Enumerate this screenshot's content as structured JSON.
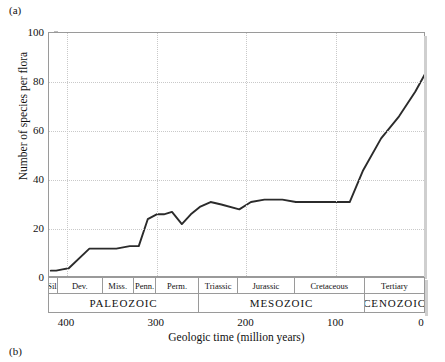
{
  "figure": {
    "panel_a_label": "(a)",
    "panel_b_label": "(b)"
  },
  "chart_data": {
    "type": "line",
    "title": "",
    "xlabel": "Geologic time (million years)",
    "ylabel": "Number of species per flora",
    "xlim": [
      420,
      0
    ],
    "ylim": [
      0,
      100
    ],
    "x_axis_reversed": true,
    "grid": "dotted",
    "legend": "none",
    "y_ticks": [
      0,
      20,
      40,
      60,
      80,
      100
    ],
    "y_tick_labels": [
      "0",
      "20",
      "40",
      "60",
      "80",
      "100"
    ],
    "x_ticks": [
      400,
      300,
      200,
      100,
      0
    ],
    "x_tick_labels": [
      "400",
      "300",
      "200",
      "100",
      "0"
    ],
    "series": [
      {
        "name": "Number of species per flora",
        "color": "#2b2b2b",
        "x": [
          418,
          412,
          405,
          398,
          375,
          360,
          352,
          345,
          330,
          320,
          310,
          300,
          292,
          283,
          272,
          262,
          252,
          240,
          228,
          208,
          195,
          180,
          160,
          145,
          130,
          118,
          100,
          85,
          70,
          50,
          30,
          12,
          0
        ],
        "y": [
          3,
          3,
          3.5,
          4,
          12,
          12,
          12,
          12,
          13,
          13,
          24,
          26,
          26,
          27,
          22,
          26,
          29,
          31,
          30,
          28,
          31,
          32,
          32,
          31,
          31,
          31,
          31,
          31,
          44,
          57,
          66,
          76,
          84
        ]
      }
    ]
  },
  "stratigraphy": {
    "periods": [
      {
        "label": "Sil.",
        "start": 420,
        "end": 410
      },
      {
        "label": "Dev.",
        "start": 410,
        "end": 360
      },
      {
        "label": "Miss.",
        "start": 360,
        "end": 325
      },
      {
        "label": "Penn.",
        "start": 325,
        "end": 300
      },
      {
        "label": "Perm.",
        "start": 300,
        "end": 252
      },
      {
        "label": "Triassic",
        "start": 252,
        "end": 208
      },
      {
        "label": "Jurassic",
        "start": 208,
        "end": 145
      },
      {
        "label": "Cretaceous",
        "start": 145,
        "end": 66
      },
      {
        "label": "Tertiary",
        "start": 66,
        "end": 0
      }
    ],
    "eras": [
      {
        "label": "PALEOZOIC",
        "start": 420,
        "end": 252
      },
      {
        "label": "MESOZOIC",
        "start": 252,
        "end": 66
      },
      {
        "label": "CENOZOIC",
        "start": 66,
        "end": 0
      }
    ]
  }
}
